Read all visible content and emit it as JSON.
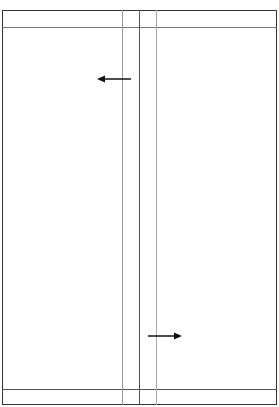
{
  "diagram": {
    "frame": {
      "x": 2,
      "y": 10,
      "width": 275,
      "height": 395,
      "color": "#333333"
    },
    "horizontal_lines": [
      {
        "y": 27,
        "color": "#777777"
      },
      {
        "y": 389,
        "color": "#555555"
      }
    ],
    "vertical_lines": [
      {
        "x": 122,
        "color": "#999999"
      },
      {
        "x": 139,
        "color": "#555555"
      },
      {
        "x": 156,
        "color": "#aaaaaa"
      }
    ],
    "arrows": [
      {
        "direction": "left",
        "x1": 131,
        "x2": 97,
        "y": 79,
        "color": "#111111"
      },
      {
        "direction": "right",
        "x1": 148,
        "x2": 182,
        "y": 336,
        "color": "#111111"
      }
    ]
  }
}
